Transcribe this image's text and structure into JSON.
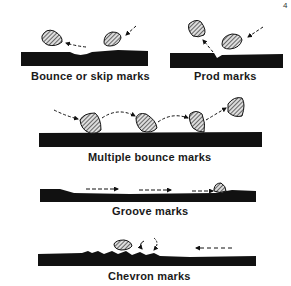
{
  "figure": {
    "page_mark": "4",
    "colors": {
      "ink": "#111111",
      "background": "#ffffff",
      "hatch": "#555555"
    },
    "panels": [
      {
        "id": "bounce-skip",
        "label": "Bounce or skip marks"
      },
      {
        "id": "prod",
        "label": "Prod marks"
      },
      {
        "id": "multiple-bounce",
        "label": "Multiple bounce marks"
      },
      {
        "id": "groove",
        "label": "Groove marks"
      },
      {
        "id": "chevron",
        "label": "Chevron marks"
      }
    ]
  }
}
